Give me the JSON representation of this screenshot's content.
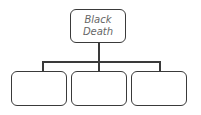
{
  "diagram": {
    "type": "tree",
    "root": {
      "line1": "Black",
      "line2": "Death"
    },
    "children": [
      {
        "label": ""
      },
      {
        "label": ""
      },
      {
        "label": ""
      }
    ]
  }
}
